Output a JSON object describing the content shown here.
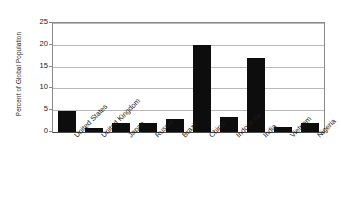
{
  "chart_data": {
    "type": "bar",
    "title": "",
    "subtitle": "",
    "xlabel": "",
    "ylabel": "Percent of Global Population",
    "categories": [
      "United States",
      "United Kingdom",
      "Japan",
      "Russia",
      "Brazil",
      "China",
      "Indonesia",
      "India",
      "Vietnam",
      "Nigeria"
    ],
    "values": [
      4.8,
      0.9,
      2.0,
      2.1,
      2.9,
      20.0,
      3.4,
      17.0,
      1.1,
      2.1
    ],
    "ylim": [
      0,
      25
    ],
    "yticks": [
      0,
      5,
      10,
      15,
      20,
      25
    ],
    "ytick_labels": [
      "0",
      "5",
      "10",
      "15",
      "20",
      "25"
    ],
    "grid": "horizontal",
    "legend": "none",
    "bar_color": "#0d0d0d",
    "gridline_color": "#b9b9b9",
    "axis_color": "#8a8a8a",
    "background_color": "#ffffff",
    "xtick_rotation_degrees": 45
  }
}
